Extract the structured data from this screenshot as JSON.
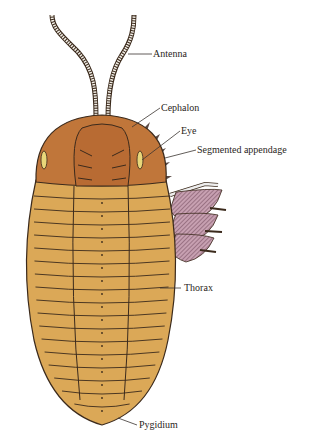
{
  "figure": {
    "labels": [
      {
        "id": "antenna",
        "text": "Antenna"
      },
      {
        "id": "cephalon",
        "text": "Cephalon"
      },
      {
        "id": "eye",
        "text": "Eye"
      },
      {
        "id": "segmented-appendage",
        "text": "Segmented appendage"
      },
      {
        "id": "thorax",
        "text": "Thorax"
      },
      {
        "id": "pygidium",
        "text": "Pygidium"
      }
    ],
    "colors": {
      "cephalon": "#c0763a",
      "cephalon_dark": "#a9622d",
      "thorax": "#dba857",
      "thorax_dark": "#c8913f",
      "appendage": "#b08396",
      "outline": "#3b2a1c",
      "eye": "#e8d77a"
    }
  }
}
